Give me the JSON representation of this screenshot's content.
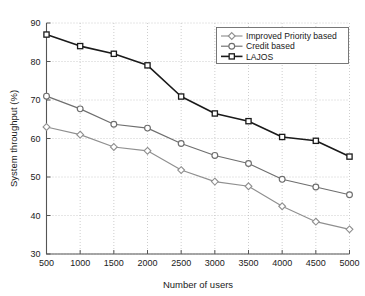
{
  "chart_data": {
    "type": "line",
    "title": "",
    "xlabel": "Number of users",
    "ylabel": "System throughput (%)",
    "x": [
      500,
      1000,
      1500,
      2000,
      2500,
      3000,
      3500,
      4000,
      4500,
      5000
    ],
    "xlim": [
      500,
      5000
    ],
    "ylim": [
      30,
      90
    ],
    "xticks": [
      "500",
      "1000",
      "1500",
      "2000",
      "2500",
      "3000",
      "3500",
      "4000",
      "4500",
      "5000"
    ],
    "yticks": [
      "30",
      "40",
      "50",
      "60",
      "70",
      "80",
      "90"
    ],
    "grid": true,
    "legend_position": "top-right",
    "series": [
      {
        "name": "Improved Priority based",
        "marker": "diamond",
        "color": "#8f8f8f",
        "values": [
          63.0,
          61.0,
          57.8,
          56.8,
          51.8,
          48.8,
          47.6,
          42.4,
          38.4,
          36.4
        ]
      },
      {
        "name": "Credit based",
        "marker": "circle",
        "color": "#6e6e6e",
        "values": [
          71.0,
          67.7,
          63.7,
          62.7,
          58.7,
          55.6,
          53.5,
          49.4,
          47.4,
          45.4
        ]
      },
      {
        "name": "LAJOS",
        "marker": "square",
        "color": "#1a1a1a",
        "values": [
          87.0,
          84.0,
          82.0,
          79.0,
          70.9,
          66.5,
          64.5,
          60.4,
          59.4,
          55.3
        ]
      }
    ]
  },
  "legend": {
    "entries": [
      {
        "label": "Improved Priority based"
      },
      {
        "label": "Credit based"
      },
      {
        "label": "LAJOS"
      }
    ]
  },
  "axes": {
    "x_title": "Number of users",
    "y_title": "System throughput (%)"
  }
}
